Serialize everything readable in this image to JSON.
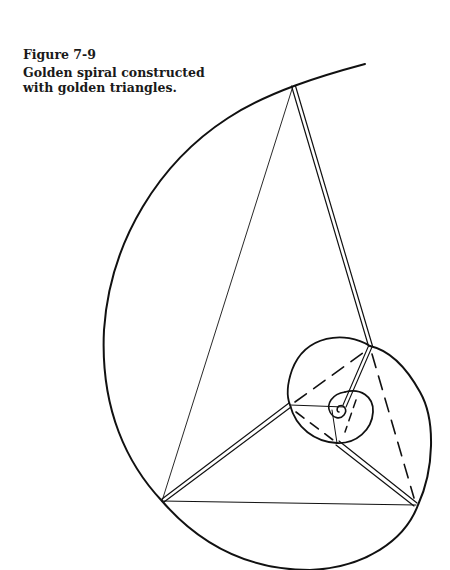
{
  "figure": {
    "number": "Figure 7-9",
    "title": "Golden spiral constructed with golden triangles."
  },
  "diagram": {
    "type": "golden-spiral",
    "stroke_color": "#111111",
    "outer_triangle": {
      "apex": [
        293,
        86
      ],
      "left": [
        162,
        501
      ],
      "right": [
        416,
        505
      ]
    },
    "inner_points": {
      "p1": [
        370,
        346
      ],
      "p2": [
        290,
        405
      ],
      "p3": [
        337,
        443
      ]
    }
  }
}
